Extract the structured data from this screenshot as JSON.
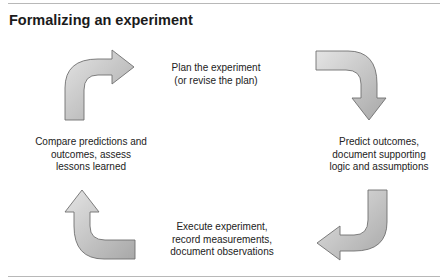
{
  "title": "Formalizing an experiment",
  "steps": [
    {
      "id": "plan",
      "label": "Plan the experiment\n(or revise the plan)"
    },
    {
      "id": "predict",
      "label": "Predict outcomes,\ndocument supporting\nlogic and assumptions"
    },
    {
      "id": "execute",
      "label": "Execute experiment,\nrecord measurements,\ndocument observations"
    },
    {
      "id": "compare",
      "label": "Compare predictions and\noutcomes, assess\nlessons learned"
    }
  ],
  "arrows": [
    {
      "from": "compare",
      "to": "plan",
      "direction": "right",
      "icon": "curved-arrow-right-icon"
    },
    {
      "from": "plan",
      "to": "predict",
      "direction": "down",
      "icon": "curved-arrow-down-icon"
    },
    {
      "from": "predict",
      "to": "execute",
      "direction": "left",
      "icon": "curved-arrow-left-icon"
    },
    {
      "from": "execute",
      "to": "compare",
      "direction": "up",
      "icon": "curved-arrow-up-icon"
    }
  ],
  "colors": {
    "arrow_fill_light": "#e2e2e2",
    "arrow_fill_dark": "#a9a9a9",
    "arrow_stroke": "#6f6f6f",
    "rule": "#b8b8b8"
  }
}
